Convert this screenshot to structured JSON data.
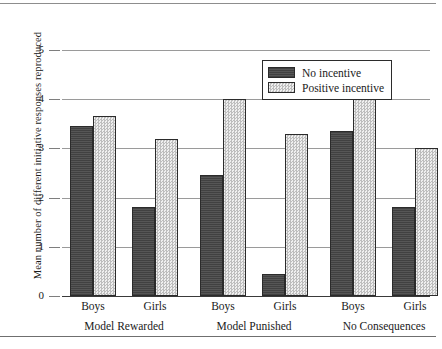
{
  "chart_data": {
    "type": "bar",
    "title": "",
    "xlabel": "",
    "ylabel": "Mean number of different initiative responses reproduced",
    "ylim": [
      0,
      5
    ],
    "yticks": [
      "0",
      "1",
      "2",
      "3",
      "4",
      "5"
    ],
    "grid": true,
    "legend_position": "top-right",
    "categories": [
      "Boys",
      "Girls",
      "Boys",
      "Girls",
      "Boys",
      "Girls"
    ],
    "groups": [
      {
        "label": "Model Rewarded",
        "bars": [
          {
            "category": "Boys",
            "series": "No incentive",
            "value": 3.45
          },
          {
            "category": "Boys",
            "series": "Positive incentive",
            "value": 3.65
          },
          {
            "category": "Girls",
            "series": "No incentive",
            "value": 1.8
          },
          {
            "category": "Girls",
            "series": "Positive incentive",
            "value": 3.2
          }
        ]
      },
      {
        "label": "Model Punished",
        "bars": [
          {
            "category": "Boys",
            "series": "No incentive",
            "value": 2.45
          },
          {
            "category": "Boys",
            "series": "Positive incentive",
            "value": 4.0
          },
          {
            "category": "Girls",
            "series": "No incentive",
            "value": 0.45
          },
          {
            "category": "Girls",
            "series": "Positive incentive",
            "value": 3.3
          }
        ]
      },
      {
        "label": "No Consequences",
        "bars": [
          {
            "category": "Boys",
            "series": "No incentive",
            "value": 3.35
          },
          {
            "category": "Boys",
            "series": "Positive incentive",
            "value": 4.0
          },
          {
            "category": "Girls",
            "series": "No incentive",
            "value": 1.8
          },
          {
            "category": "Girls",
            "series": "Positive incentive",
            "value": 3.0
          }
        ]
      }
    ],
    "series": [
      {
        "name": "No incentive",
        "values": [
          3.45,
          1.8,
          2.45,
          0.45,
          3.35,
          1.8
        ]
      },
      {
        "name": "Positive incentive",
        "values": [
          3.65,
          3.2,
          4.0,
          3.3,
          4.0,
          3.0
        ]
      }
    ]
  },
  "legend": {
    "entries": [
      {
        "label": "No incentive",
        "swatch": "dark"
      },
      {
        "label": "Positive incentive",
        "swatch": "light"
      }
    ]
  },
  "colors": {
    "no_incentive": "#4d4d4d",
    "positive_incentive": "#d2d2d2",
    "bar_outline": "#2b2b2b",
    "gridline": "#9a9a9a",
    "axis": "#3a3a3a"
  }
}
